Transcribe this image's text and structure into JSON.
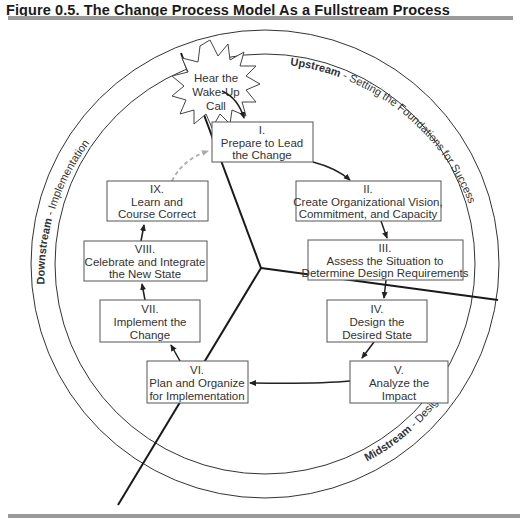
{
  "figure": {
    "title": "Figure 0.5.  The Change Process Model As a Fullstream Process"
  },
  "rings": {
    "upstream": {
      "label": "Upstream",
      "desc": " - Setting the Foundations for Success"
    },
    "midstream": {
      "label": "Midstream",
      "desc": " - Design"
    },
    "downstream": {
      "label": "Downstream",
      "desc": " - Implementation"
    }
  },
  "trigger": {
    "lines": [
      "Hear the",
      "Wake-Up",
      "Call"
    ]
  },
  "stages": [
    {
      "numeral": "I.",
      "lines": [
        "Prepare to Lead",
        "the Change"
      ]
    },
    {
      "numeral": "II.",
      "lines": [
        "Create Organizational Vision,",
        "Commitment, and Capacity"
      ]
    },
    {
      "numeral": "III.",
      "lines": [
        "Assess the Situation to",
        "Determine Design Requirements"
      ]
    },
    {
      "numeral": "IV.",
      "lines": [
        "Design the",
        "Desired State"
      ]
    },
    {
      "numeral": "V.",
      "lines": [
        "Analyze the",
        "Impact"
      ]
    },
    {
      "numeral": "VI.",
      "lines": [
        "Plan and Organize",
        "for Implementation"
      ]
    },
    {
      "numeral": "VII.",
      "lines": [
        "Implement the",
        "Change"
      ]
    },
    {
      "numeral": "VIII.",
      "lines": [
        "Celebrate and Integrate",
        "the New State"
      ]
    },
    {
      "numeral": "IX.",
      "lines": [
        "Learn and",
        "Course Correct"
      ]
    }
  ],
  "colors": {
    "rule": "#9a9a9a",
    "line": "#222222",
    "dashed_arrow": "#aaaaaa",
    "box_border": "#555555"
  }
}
